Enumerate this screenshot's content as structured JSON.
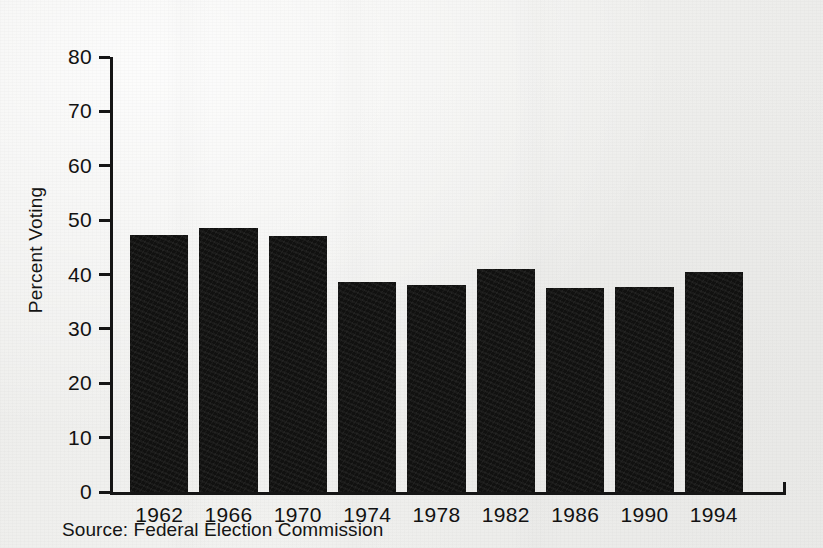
{
  "chart_data": {
    "type": "bar",
    "title": "",
    "subtitle": "",
    "xlabel": "",
    "ylabel": "Percent Voting",
    "categories": [
      "1962",
      "1966",
      "1970",
      "1974",
      "1978",
      "1982",
      "1986",
      "1990",
      "1994"
    ],
    "values": [
      47.3,
      48.6,
      47.0,
      38.7,
      38.0,
      41.1,
      37.5,
      37.7,
      40.4
    ],
    "ylim": [
      0,
      80
    ],
    "ytick_values": [
      0,
      10,
      20,
      30,
      40,
      50,
      60,
      70,
      80
    ],
    "ytick_labels": [
      "0",
      "10",
      "20",
      "30",
      "40",
      "50",
      "60",
      "70",
      "80"
    ],
    "grid": false,
    "legend": null,
    "legend_position": "none",
    "bar_color": "#111110",
    "axis_color": "#151515",
    "background_color": "#f1f1ef",
    "annotations": []
  },
  "caption": {
    "source_text": "Source: Federal Election Commission"
  }
}
